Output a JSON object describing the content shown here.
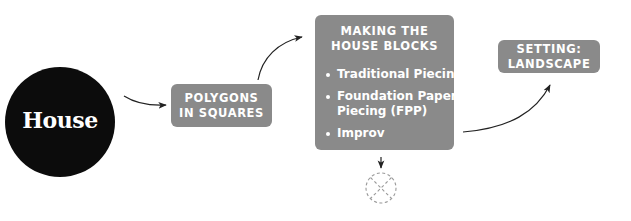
{
  "diagram": {
    "start_node": {
      "label": "House",
      "shape": "circle",
      "fill": "#0c0c0c",
      "text_color": "#ffffff"
    },
    "nodes": [
      {
        "id": "polygons",
        "title": "POLYGONS IN SQUARES",
        "title_lines": [
          "POLYGONS",
          "IN SQUARES"
        ]
      },
      {
        "id": "making",
        "title": "MAKING THE HOUSE BLOCKS",
        "title_lines": [
          "MAKING THE",
          "HOUSE BLOCKS"
        ],
        "items": [
          "Traditional Piecing",
          "Foundation Paper Piecing (FPP)",
          "Improv"
        ],
        "item_lines": [
          [
            "Traditional Piecing"
          ],
          [
            "Foundation Paper",
            "Piecing (FPP)"
          ],
          [
            "Improv"
          ]
        ]
      },
      {
        "id": "setting",
        "title": "SETTING: LANDSCAPE",
        "title_lines": [
          "SETTING:",
          "LANDSCAPE"
        ]
      }
    ],
    "end_marker": {
      "shape": "dashed-circle-with-x",
      "meaning": "no further path"
    },
    "edges": [
      {
        "from": "House",
        "to": "polygons"
      },
      {
        "from": "polygons",
        "to": "making"
      },
      {
        "from": "making",
        "to": "setting"
      },
      {
        "from": "making",
        "to": "end_marker"
      }
    ],
    "colors": {
      "box_fill": "#8a8a8a",
      "box_text": "#ffffff",
      "arrow": "#222222",
      "dashed": "#9a9a9a",
      "background": "#ffffff"
    }
  }
}
